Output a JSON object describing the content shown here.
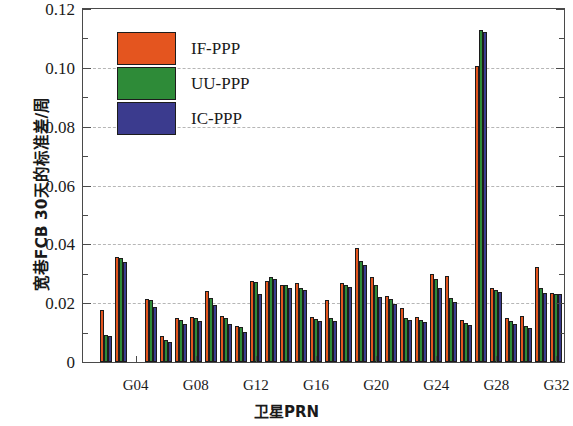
{
  "chart_data": {
    "type": "bar",
    "title": "",
    "xlabel": "卫星PRN",
    "ylabel": "宽巷FCB 30天的标准差/周",
    "ylim": [
      0,
      0.12
    ],
    "ytick_labels": [
      "0",
      "0.02",
      "0.04",
      "0.06",
      "0.08",
      "0.10",
      "0.12"
    ],
    "ytick_values": [
      0,
      0.02,
      0.04,
      0.06,
      0.08,
      0.1,
      0.12
    ],
    "yminor_values": [
      0.01,
      0.03,
      0.05,
      0.07,
      0.09,
      0.11
    ],
    "grid": "horizontal-dashed",
    "legend_position": "upper-left-inside",
    "categories": [
      "G01",
      "G02",
      "G03",
      "G04",
      "G05",
      "G06",
      "G07",
      "G08",
      "G09",
      "G10",
      "G11",
      "G12",
      "G13",
      "G14",
      "G15",
      "G16",
      "G17",
      "G18",
      "G19",
      "G20",
      "G21",
      "G22",
      "G23",
      "G24",
      "G25",
      "G26",
      "G27",
      "G28",
      "G29",
      "G30",
      "G31",
      "G32"
    ],
    "xtick_labels": [
      "G04",
      "G08",
      "G12",
      "G16",
      "G20",
      "G24",
      "G28",
      "G32"
    ],
    "xtick_categories": [
      "G04",
      "G08",
      "G12",
      "G16",
      "G20",
      "G24",
      "G28",
      "G32"
    ],
    "series": [
      {
        "name": "IF-PPP",
        "color": "#E4551F",
        "values": [
          0.0,
          0.0178,
          0.0358,
          0.0,
          0.0215,
          0.009,
          0.0148,
          0.0152,
          0.0242,
          0.0155,
          0.0122,
          0.0275,
          0.0275,
          0.0262,
          0.0268,
          0.0152,
          0.0212,
          0.0268,
          0.0388,
          0.029,
          0.0225,
          0.0185,
          0.0152,
          0.03,
          0.0292,
          0.0142,
          0.1005,
          0.025,
          0.0148,
          0.0158,
          0.0322,
          0.0235
        ]
      },
      {
        "name": "UU-PPP",
        "color": "#2E8B38",
        "values": [
          0.0,
          0.0092,
          0.0352,
          0.0,
          0.0212,
          0.0075,
          0.0142,
          0.0148,
          0.0218,
          0.015,
          0.0118,
          0.0272,
          0.0288,
          0.0262,
          0.0252,
          0.0145,
          0.0148,
          0.0262,
          0.0345,
          0.0262,
          0.0215,
          0.0148,
          0.0142,
          0.0282,
          0.0218,
          0.0132,
          0.1128,
          0.0245,
          0.014,
          0.0122,
          0.025,
          0.0232
        ]
      },
      {
        "name": "IC-PPP",
        "color": "#3B3B8E",
        "values": [
          0.0,
          0.009,
          0.034,
          0.0,
          0.0188,
          0.0068,
          0.013,
          0.014,
          0.0195,
          0.0128,
          0.0102,
          0.0232,
          0.0282,
          0.0252,
          0.0245,
          0.0138,
          0.014,
          0.0255,
          0.033,
          0.0222,
          0.0198,
          0.0142,
          0.0135,
          0.025,
          0.0205,
          0.0125,
          0.1122,
          0.0238,
          0.0128,
          0.0115,
          0.0235,
          0.023
        ]
      }
    ]
  },
  "legend": {
    "items": [
      {
        "label": "IF-PPP",
        "color": "#E4551F"
      },
      {
        "label": "UU-PPP",
        "color": "#2E8B38"
      },
      {
        "label": "IC-PPP",
        "color": "#3B3B8E"
      }
    ]
  },
  "axes": {
    "y_title": "宽巷FCB 30天的标准差/周",
    "x_title": "卫星PRN"
  }
}
